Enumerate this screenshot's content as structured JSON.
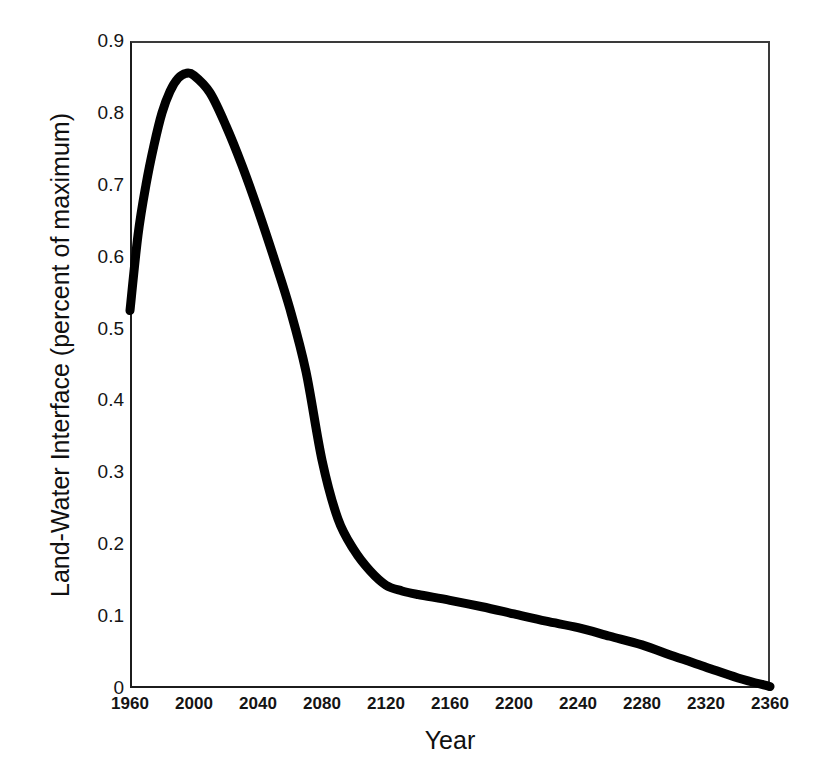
{
  "chart_data": {
    "type": "line",
    "title": "",
    "xlabel": "Year",
    "ylabel": "Land-Water Interface (percent of maximum)",
    "xlim": [
      1960,
      2360
    ],
    "ylim": [
      0,
      0.9
    ],
    "xticks": [
      1960,
      2000,
      2040,
      2080,
      2120,
      2160,
      2200,
      2240,
      2280,
      2320,
      2360
    ],
    "xtick_labels": [
      "1960",
      "2000",
      "2040",
      "2080",
      "2120",
      "2160",
      "2200",
      "2240",
      "2280",
      "2320",
      "2360"
    ],
    "yticks": [
      0,
      0.1,
      0.2,
      0.3,
      0.4,
      0.5,
      0.6,
      0.7,
      0.8,
      0.9
    ],
    "ytick_labels": [
      "0",
      "0.1",
      "0.2",
      "0.3",
      "0.4",
      "0.5",
      "0.6",
      "0.7",
      "0.8",
      "0.9"
    ],
    "grid": false,
    "legend": "none",
    "line_color": "#000000",
    "line_width_px": 9,
    "series": [
      {
        "name": "Land-Water Interface",
        "x": [
          1960,
          1965,
          1970,
          1975,
          1980,
          1985,
          1990,
          1995,
          2000,
          2010,
          2020,
          2030,
          2040,
          2050,
          2060,
          2070,
          2080,
          2090,
          2100,
          2110,
          2120,
          2130,
          2140,
          2160,
          2180,
          2200,
          2220,
          2240,
          2260,
          2280,
          2300,
          2320,
          2340,
          2360
        ],
        "y": [
          0.525,
          0.63,
          0.7,
          0.755,
          0.8,
          0.83,
          0.848,
          0.855,
          0.852,
          0.828,
          0.782,
          0.727,
          0.665,
          0.598,
          0.527,
          0.44,
          0.317,
          0.235,
          0.192,
          0.163,
          0.143,
          0.135,
          0.13,
          0.122,
          0.113,
          0.103,
          0.093,
          0.084,
          0.072,
          0.06,
          0.044,
          0.029,
          0.014,
          0.002
        ]
      }
    ]
  }
}
